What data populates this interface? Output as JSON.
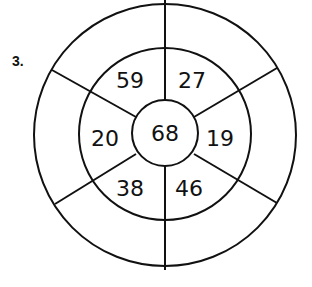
{
  "problem": {
    "number_label": "3."
  },
  "wheel": {
    "center": "68",
    "inner_ring": {
      "top_left": "59",
      "top_right": "27",
      "right": "19",
      "bottom_right": "46",
      "bottom_left": "38",
      "left": "20"
    },
    "outer_ring": {
      "top_left": "",
      "top_right": "",
      "right": "",
      "bottom_right": "",
      "bottom_left": "",
      "left": ""
    },
    "stroke_color": "#111111",
    "background_color": "#ffffff"
  }
}
